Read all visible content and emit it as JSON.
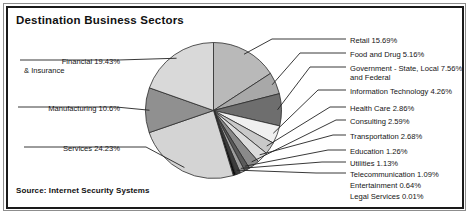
{
  "figure": {
    "title": "Destination Business Sectors",
    "source": "Source: Internet Security Systems"
  },
  "chart_data": {
    "type": "pie",
    "title": "Destination Business Sectors",
    "xlabel": "",
    "ylabel": "",
    "units": "percent",
    "legend_position": "callout-labels",
    "grid": false,
    "source": "Source: Internet Security Systems",
    "categories": [
      "Services",
      "Financial & Insurance",
      "Retail",
      "Manufacturing",
      "Government - State, Local and Federal",
      "Food and Drug",
      "Information Technology",
      "Health Care",
      "Transportation",
      "Consulting",
      "Education",
      "Utilities",
      "Telecommunication",
      "Entertainment",
      "Legal Services"
    ],
    "values": [
      24.23,
      19.43,
      15.69,
      10.6,
      7.56,
      5.16,
      4.26,
      2.86,
      2.68,
      2.59,
      1.26,
      1.13,
      1.09,
      0.64,
      0.01
    ],
    "slices": [
      {
        "label": "Retail",
        "value": 15.69,
        "display": "Retail 15.69%",
        "color": "#b9b9b9",
        "side": "right"
      },
      {
        "label": "Food and Drug",
        "value": 5.16,
        "display": "Food and Drug 5.16%",
        "color": "#a8a8a8",
        "side": "right"
      },
      {
        "label": "Government - State, Local and Federal",
        "value": 7.56,
        "display": "Government - State, Local 7.56%",
        "display_line2": "and Federal",
        "color": "#6e6e6e",
        "side": "right"
      },
      {
        "label": "Information Technology",
        "value": 4.26,
        "display": "Information Technology 4.26%",
        "color": "#f0f0f0",
        "side": "right"
      },
      {
        "label": "Health Care",
        "value": 2.86,
        "display": "Health Care 2.86%",
        "color": "#c9c9c9",
        "side": "right"
      },
      {
        "label": "Consulting",
        "value": 2.59,
        "display": "Consulting 2.59%",
        "color": "#8a8a8a",
        "side": "right"
      },
      {
        "label": "Transportation",
        "value": 2.68,
        "display": "Transportation 2.68%",
        "color": "#dcdcdc",
        "side": "right"
      },
      {
        "label": "Education",
        "value": 1.26,
        "display": "Education 1.26%",
        "color": "#5a5a5a",
        "side": "right"
      },
      {
        "label": "Utilities",
        "value": 1.13,
        "display": "Utilities 1.13%",
        "color": "#9e9e9e",
        "side": "right"
      },
      {
        "label": "Telecommunication",
        "value": 1.09,
        "display": "Telecommunication 1.09%",
        "color": "#3c3c3c",
        "side": "right"
      },
      {
        "label": "Entertainment",
        "value": 0.64,
        "display": "Entertainment 0.64%",
        "color": "#0d0d0d",
        "side": "right"
      },
      {
        "label": "Legal Services",
        "value": 0.01,
        "display": "Legal Services 0.01%",
        "color": "#000000",
        "side": "right"
      },
      {
        "label": "Services",
        "value": 24.23,
        "display": "Services 24.23%",
        "color": "#d4d4d4",
        "side": "left"
      },
      {
        "label": "Manufacturing",
        "value": 10.6,
        "display": "Manufacturing 10.6%",
        "color": "#909090",
        "side": "left"
      },
      {
        "label": "Financial & Insurance",
        "value": 19.43,
        "display": "Financial 19.43%",
        "display_line2": "& Insurance",
        "color": "#d9d9d9",
        "side": "left"
      }
    ]
  },
  "colors": {
    "frame": "#1a1a1a",
    "outer_frame": "#8d8d8d",
    "background": "#ffffff",
    "text": "#151515",
    "leader_line": "#222222",
    "slice_outline": "#2b2b2b"
  }
}
